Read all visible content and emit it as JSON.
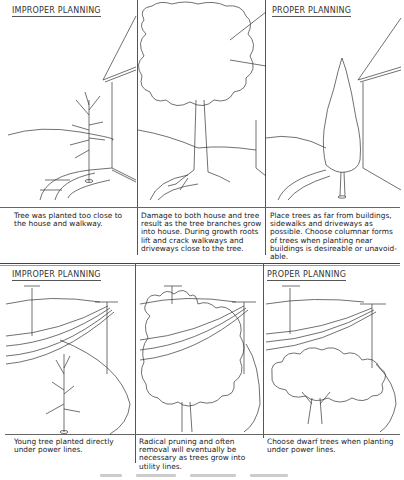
{
  "top_row": {
    "panels": [
      {
        "heading": "IMPROPER PLANNING",
        "description": "Tree was planted too close to the house and walkway."
      },
      {
        "heading": "",
        "description": "Damage to both house and tree result as the tree branches grow into house. During growth roots lift and crack walkways and driveways close to the tree."
      },
      {
        "heading": "PROPER PLANNING",
        "description": "Place trees as far from buildings, sidewalks and driveways as possible. Choose columnar forms of trees when planting near buildings is desireable or unavoid-able."
      }
    ]
  },
  "bottom_row": {
    "panels": [
      {
        "heading": "IMPROPER PLANNING",
        "description": "Young tree planted directly under power lines."
      },
      {
        "heading": "",
        "description": "Radical pruning and often removal will eventually be necessary as trees grow into utility lines."
      },
      {
        "heading": "PROPER PLANNING",
        "description": "Choose dwarf trees when planting under power lines."
      }
    ]
  },
  "illustrations": {
    "top": [
      "young-bare-tree-near-house",
      "mature-tree-overgrowing-house",
      "columnar-tree-near-house"
    ],
    "bottom": [
      "young-tree-under-power-lines",
      "large-tree-in-power-lines",
      "dwarf-tree-beside-power-lines"
    ]
  }
}
